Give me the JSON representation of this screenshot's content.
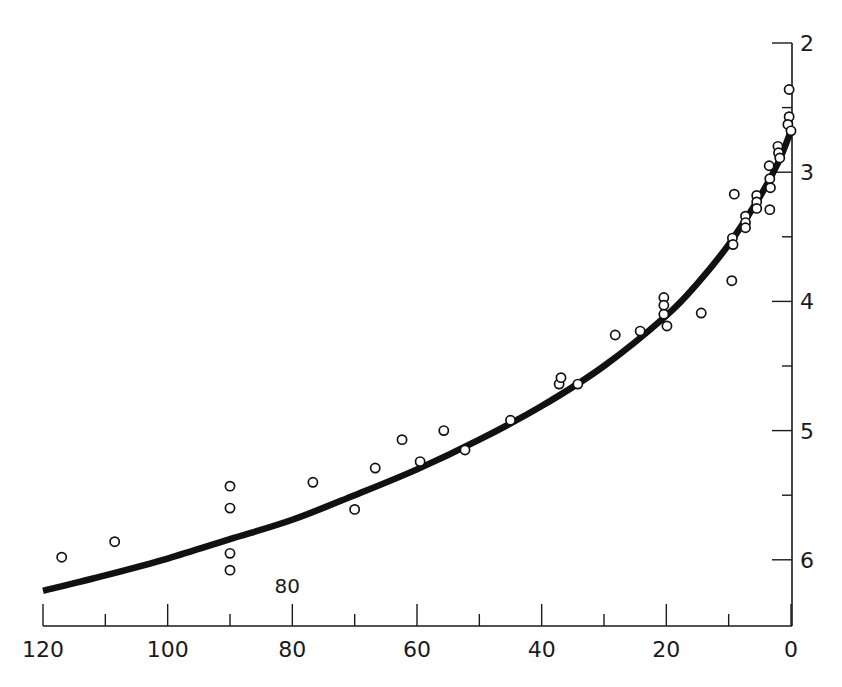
{
  "chart_data": {
    "type": "scatter",
    "title": "",
    "xlabel": "",
    "ylabel": "",
    "x_axis": {
      "position": "bottom",
      "reversed": true,
      "range": [
        120,
        0
      ],
      "major_ticks": [
        120,
        100,
        80,
        60,
        40,
        20,
        0
      ],
      "minor_ticks": [
        110,
        90,
        70,
        50,
        30,
        10
      ],
      "tick_labels": [
        "120",
        "100",
        "80",
        "60",
        "40",
        "20",
        "0"
      ]
    },
    "y_axis": {
      "position": "right",
      "inverted": true,
      "range": [
        2,
        6.5
      ],
      "major_ticks": [
        2,
        3,
        4,
        5,
        6
      ],
      "minor_ticks": [
        2.5,
        3.5,
        4.5,
        5.5
      ],
      "tick_labels": [
        "2",
        "3",
        "4",
        "5",
        "6"
      ]
    },
    "grid": false,
    "legend": null,
    "annotations": [
      {
        "text": "80",
        "x": 80,
        "y": 6.15
      }
    ],
    "series": [
      {
        "name": "observations",
        "marker": "open-circle",
        "points": [
          [
            117,
            5.98
          ],
          [
            108.5,
            5.86
          ],
          [
            90,
            5.43
          ],
          [
            90,
            5.6
          ],
          [
            90,
            5.95
          ],
          [
            90,
            6.08
          ],
          [
            76.7,
            5.4
          ],
          [
            70,
            5.61
          ],
          [
            66.7,
            5.29
          ],
          [
            62.4,
            5.07
          ],
          [
            59.5,
            5.24
          ],
          [
            55.7,
            5.0
          ],
          [
            52.3,
            5.15
          ],
          [
            45,
            4.92
          ],
          [
            37.2,
            4.64
          ],
          [
            36.9,
            4.59
          ],
          [
            34.2,
            4.64
          ],
          [
            28.2,
            4.26
          ],
          [
            24.2,
            4.23
          ],
          [
            20.4,
            3.97
          ],
          [
            20.4,
            4.03
          ],
          [
            20.4,
            4.1
          ],
          [
            19.9,
            4.19
          ],
          [
            14.4,
            4.09
          ],
          [
            9.5,
            3.84
          ],
          [
            9.4,
            3.51
          ],
          [
            9.3,
            3.56
          ],
          [
            9.1,
            3.17
          ],
          [
            7.3,
            3.34
          ],
          [
            7.3,
            3.39
          ],
          [
            7.3,
            3.43
          ],
          [
            5.5,
            3.18
          ],
          [
            5.5,
            3.23
          ],
          [
            5.5,
            3.28
          ],
          [
            3.4,
            3.29
          ],
          [
            3.5,
            2.95
          ],
          [
            3.4,
            3.05
          ],
          [
            3.3,
            3.12
          ],
          [
            2.1,
            2.8
          ],
          [
            2.0,
            2.85
          ],
          [
            1.8,
            2.89
          ],
          [
            0.3,
            2.36
          ],
          [
            0.3,
            2.57
          ],
          [
            0.5,
            2.63
          ],
          [
            0.0,
            2.68
          ]
        ]
      },
      {
        "name": "fitted curve",
        "type": "line",
        "points": [
          [
            120,
            6.24
          ],
          [
            110,
            6.12
          ],
          [
            100,
            5.99
          ],
          [
            90,
            5.84
          ],
          [
            80,
            5.69
          ],
          [
            70,
            5.5
          ],
          [
            60,
            5.3
          ],
          [
            50,
            5.07
          ],
          [
            40,
            4.81
          ],
          [
            30,
            4.5
          ],
          [
            20,
            4.11
          ],
          [
            15,
            3.86
          ],
          [
            10,
            3.56
          ],
          [
            5,
            3.19
          ],
          [
            2,
            2.92
          ],
          [
            0,
            2.68
          ]
        ]
      }
    ]
  }
}
